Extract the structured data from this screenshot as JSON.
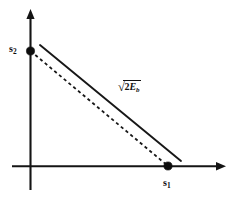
{
  "figure": {
    "background_color": "#ffffff",
    "ink_color": "#141414",
    "axes": {
      "x_axis_label": "s",
      "x_axis_subscript": "1",
      "y_axis_label": "s",
      "y_axis_subscript": "2",
      "origin": {
        "x": 30,
        "y": 166
      },
      "x_axis_start": {
        "x": 12,
        "y": 166
      },
      "x_axis_end": {
        "x": 226,
        "y": 166
      },
      "y_axis_top": {
        "x": 30,
        "y": 10
      },
      "y_axis_bottom": {
        "x": 30,
        "y": 190
      },
      "x_arrowhead": "right",
      "y_arrowhead": "up"
    },
    "points": [
      {
        "name": "s2-point",
        "label": "s2",
        "x": 30,
        "y": 51,
        "on_axis": "y"
      },
      {
        "name": "s1-point",
        "label": "s1",
        "x": 168,
        "y": 166,
        "on_axis": "x"
      }
    ],
    "lines": [
      {
        "name": "solid-distance-line",
        "style": "solid",
        "from": {
          "x": 40,
          "y": 45
        },
        "to": {
          "x": 181,
          "y": 161
        }
      },
      {
        "name": "dashed-distance-line",
        "style": "dashed",
        "from": {
          "x": 30,
          "y": 51
        },
        "to": {
          "x": 168,
          "y": 166
        }
      }
    ],
    "annotation": {
      "name": "distance-label",
      "text": "√(2E_b)",
      "radical_symbol": "√",
      "coefficient": "2",
      "symbol": "E",
      "subscript": "b",
      "x": 117,
      "y": 80
    }
  }
}
